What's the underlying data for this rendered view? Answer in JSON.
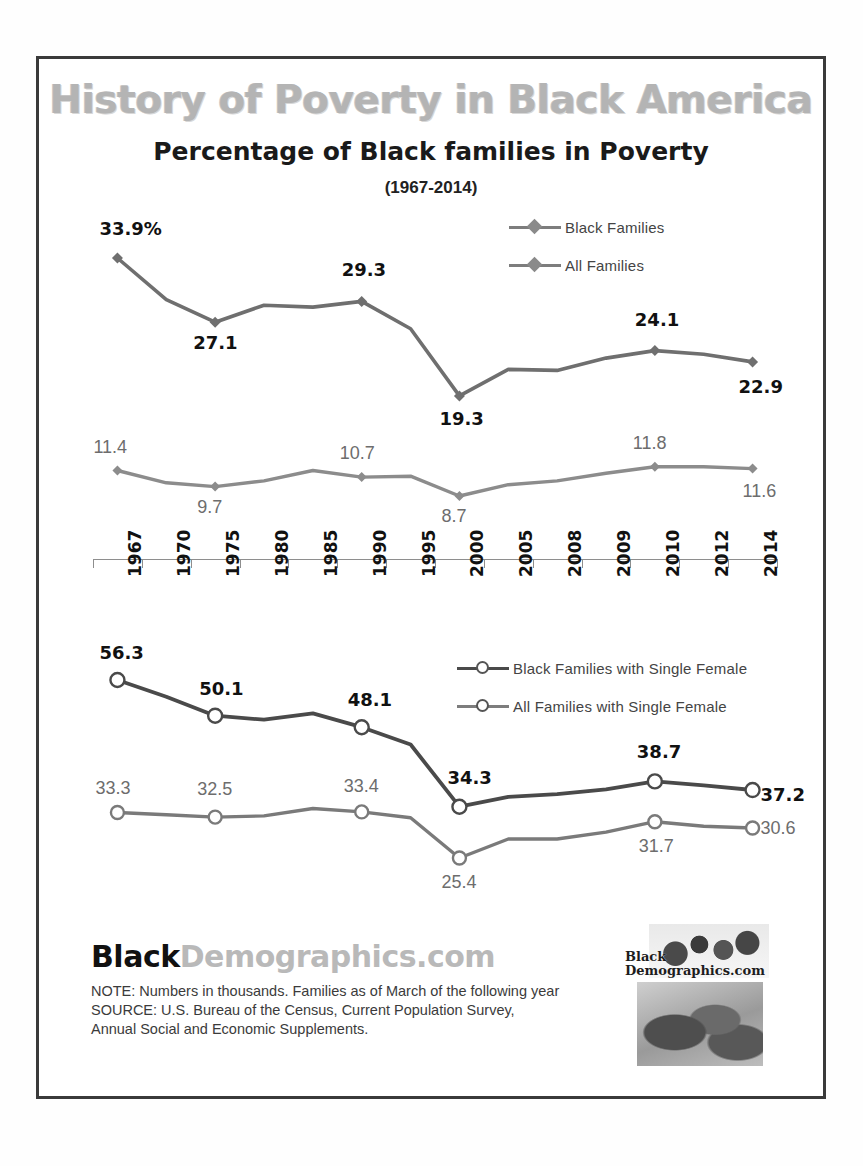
{
  "banner_title": "History of Poverty in Black America",
  "subtitle": "Percentage of Black families in Poverty",
  "year_span": "(1967-2014)",
  "legend_top": [
    {
      "label": "Black Families",
      "marker": "diamond-marker"
    },
    {
      "label": "All Families",
      "marker": "diamond-marker"
    }
  ],
  "legend_bottom": [
    {
      "label": "Black Families with Single Female",
      "marker": "circle-marker"
    },
    {
      "label": "All Families with Single Female",
      "marker": "circle-marker"
    }
  ],
  "footer": {
    "logo_black": "Black",
    "logo_demographics": "Demographics.com",
    "note": "NOTE:  Numbers in thousands. Families  as of March of the following year",
    "source": "SOURCE:  U.S. Bureau of the Census, Current Population Survey, Annual Social and Economic  Supplements.",
    "badge_line1": "Black",
    "badge_line2": "Demographics.com"
  },
  "colors": {
    "black_families_line": "#6f6f6f",
    "all_families_line": "#8c8c8c",
    "black_single_female_line": "#4a4a4a",
    "all_single_female_line": "#7a7a7a",
    "banner_text": "#b4b4b4",
    "frame": "#3a3a3a",
    "label_bold": "#111111",
    "label_grey": "#6d6d6d"
  },
  "chart_data": [
    {
      "type": "line",
      "title": "Percentage of Black families in Poverty",
      "subtitle": "(1967-2014)",
      "xlabel": "",
      "ylabel": "",
      "grid": false,
      "legend_position": "top-right",
      "ylim": [
        0,
        40
      ],
      "categories": [
        "1967",
        "1970",
        "1975",
        "1980",
        "1985",
        "1990",
        "1995",
        "2000",
        "2005",
        "2008",
        "2009",
        "2010",
        "2012",
        "2014"
      ],
      "series": [
        {
          "name": "Black Families",
          "values": [
            33.9,
            29.5,
            27.1,
            28.9,
            28.7,
            29.3,
            26.4,
            19.3,
            22.1,
            22.0,
            23.3,
            24.1,
            23.7,
            22.9
          ],
          "labeled_points": [
            {
              "category": "1967",
              "value": 33.9,
              "text": "33.9%"
            },
            {
              "category": "1975",
              "value": 27.1,
              "text": "27.1"
            },
            {
              "category": "1990",
              "value": 29.3,
              "text": "29.3"
            },
            {
              "category": "2000",
              "value": 19.3,
              "text": "19.3"
            },
            {
              "category": "2010",
              "value": 24.1,
              "text": "24.1"
            },
            {
              "category": "2014",
              "value": 22.9,
              "text": "22.9"
            }
          ]
        },
        {
          "name": "All Families",
          "values": [
            11.4,
            10.1,
            9.7,
            10.3,
            11.4,
            10.7,
            10.8,
            8.7,
            9.9,
            10.3,
            11.1,
            11.8,
            11.8,
            11.6
          ],
          "labeled_points": [
            {
              "category": "1967",
              "value": 11.4,
              "text": "11.4"
            },
            {
              "category": "1975",
              "value": 9.7,
              "text": "9.7"
            },
            {
              "category": "1990",
              "value": 10.7,
              "text": "10.7"
            },
            {
              "category": "2000",
              "value": 8.7,
              "text": "8.7"
            },
            {
              "category": "2010",
              "value": 11.8,
              "text": "11.8"
            },
            {
              "category": "2014",
              "value": 11.6,
              "text": "11.6"
            }
          ]
        }
      ]
    },
    {
      "type": "line",
      "title": "",
      "xlabel": "",
      "ylabel": "",
      "grid": false,
      "legend_position": "top-right",
      "ylim": [
        0,
        60
      ],
      "categories": [
        "1967",
        "1970",
        "1975",
        "1980",
        "1985",
        "1990",
        "1995",
        "2000",
        "2005",
        "2008",
        "2009",
        "2010",
        "2012",
        "2014"
      ],
      "series": [
        {
          "name": "Black Families with Single Female",
          "values": [
            56.3,
            53.4,
            50.1,
            49.4,
            50.5,
            48.1,
            45.1,
            34.3,
            36.0,
            36.5,
            37.3,
            38.7,
            38.0,
            37.2
          ],
          "labeled_points": [
            {
              "category": "1967",
              "value": 56.3,
              "text": "56.3"
            },
            {
              "category": "1975",
              "value": 50.1,
              "text": "50.1"
            },
            {
              "category": "1990",
              "value": 48.1,
              "text": "48.1"
            },
            {
              "category": "2000",
              "value": 34.3,
              "text": "34.3"
            },
            {
              "category": "2010",
              "value": 38.7,
              "text": "38.7"
            },
            {
              "category": "2014",
              "value": 37.2,
              "text": "37.2"
            }
          ]
        },
        {
          "name": "All Families with Single Female",
          "values": [
            33.3,
            32.9,
            32.5,
            32.7,
            34.0,
            33.4,
            32.4,
            25.4,
            28.7,
            28.7,
            29.9,
            31.7,
            30.9,
            30.6
          ],
          "labeled_points": [
            {
              "category": "1967",
              "value": 33.3,
              "text": "33.3"
            },
            {
              "category": "1975",
              "value": 32.5,
              "text": "32.5"
            },
            {
              "category": "1990",
              "value": 33.4,
              "text": "33.4"
            },
            {
              "category": "2000",
              "value": 25.4,
              "text": "25.4"
            },
            {
              "category": "2010",
              "value": 31.7,
              "text": "31.7"
            },
            {
              "category": "2014",
              "value": 30.6,
              "text": "30.6"
            }
          ]
        }
      ]
    }
  ],
  "axis_years": [
    "1967",
    "1970",
    "1975",
    "1980",
    "1985",
    "1990",
    "1995",
    "2000",
    "2005",
    "2008",
    "2009",
    "2010",
    "2012",
    "2014"
  ]
}
